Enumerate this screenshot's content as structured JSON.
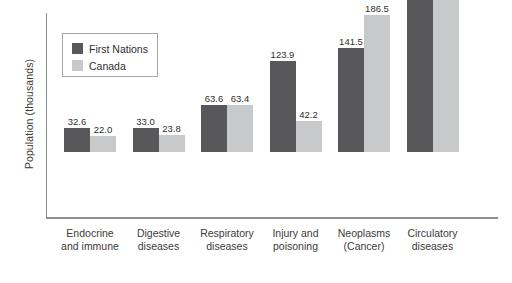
{
  "chart_data": {
    "type": "bar",
    "title": "",
    "subtitle": "",
    "xlabel": "",
    "ylabel": "Population (thousands)",
    "ylim": [
      0,
      245
    ],
    "grid": false,
    "legend_position": "top-left",
    "categories": [
      "Endocrine and immune",
      "Digestive diseases",
      "Respiratory diseases",
      "Injury and poisoning",
      "Neoplasms (Cancer)",
      "Circulatory diseases"
    ],
    "category_lines": [
      [
        "Endocrine",
        "and immune"
      ],
      [
        "Digestive",
        "diseases"
      ],
      [
        "Respiratory",
        "diseases"
      ],
      [
        "Injury and",
        "poisoning"
      ],
      [
        "Neoplasms",
        "(Cancer)"
      ],
      [
        "Circulatory",
        "diseases"
      ]
    ],
    "series": [
      {
        "name": "First Nations",
        "color": "#58585a",
        "values": [
          32.6,
          33.0,
          63.6,
          123.9,
          141.5,
          213.6
        ],
        "labels": [
          "32.6",
          "33.0",
          "63.6",
          "123.9",
          "141.5",
          "213.6"
        ]
      },
      {
        "name": "Canada",
        "color": "#c8c9cb",
        "values": [
          22.0,
          23.8,
          63.4,
          42.2,
          186.5,
          231.8
        ],
        "labels": [
          "22.0",
          "23.8",
          "63.4",
          "42.2",
          "186.5",
          "231.8"
        ]
      }
    ]
  },
  "axis": {
    "line_color": "#8d8d8d"
  },
  "legend": {
    "entries": [
      {
        "label": "First Nations",
        "color": "#58585a"
      },
      {
        "label": "Canada",
        "color": "#c8c9cb"
      }
    ]
  }
}
